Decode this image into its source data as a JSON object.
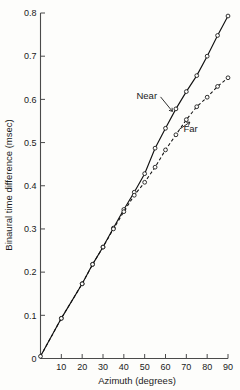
{
  "chart_data": {
    "type": "line",
    "title": "",
    "xlabel": "Azimuth (degrees)",
    "ylabel": "Binaural time difference (msec)",
    "xlim": [
      0,
      90
    ],
    "ylim": [
      0,
      0.8
    ],
    "xticks": [
      0,
      10,
      20,
      30,
      40,
      50,
      60,
      70,
      80,
      90
    ],
    "xtick_labels": [
      "0",
      "10",
      "20",
      "30",
      "40",
      "50",
      "60",
      "70",
      "80",
      "90"
    ],
    "yticks": [
      0,
      0.1,
      0.2,
      0.3,
      0.4,
      0.5,
      0.6,
      0.7,
      0.8
    ],
    "ytick_labels": [
      "0",
      "0.1",
      "0.2",
      "0.3",
      "0.4",
      "0.5",
      "0.6",
      "0.7",
      "0.8"
    ],
    "grid": false,
    "legend_position": "inline-annotation",
    "marker": "open-circle",
    "series": [
      {
        "name": "Near",
        "label": "Near",
        "line_style": "solid",
        "x": [
          0,
          10,
          20,
          25,
          30,
          35,
          40,
          45,
          50,
          55,
          60,
          65,
          70,
          75,
          80,
          85,
          90
        ],
        "values": [
          0.005,
          0.093,
          0.173,
          0.218,
          0.258,
          0.302,
          0.345,
          0.385,
          0.428,
          0.487,
          0.533,
          0.578,
          0.618,
          0.655,
          0.7,
          0.748,
          0.793
        ]
      },
      {
        "name": "Far",
        "label": "Far",
        "line_style": "dashed",
        "x": [
          0,
          10,
          20,
          25,
          30,
          35,
          40,
          45,
          50,
          55,
          60,
          65,
          70,
          75,
          80,
          85,
          90
        ],
        "values": [
          0.005,
          0.093,
          0.173,
          0.218,
          0.258,
          0.3,
          0.34,
          0.378,
          0.408,
          0.443,
          0.483,
          0.518,
          0.553,
          0.583,
          0.605,
          0.63,
          0.65
        ]
      }
    ],
    "annotations": [
      {
        "text": "Near",
        "target_series": "Near",
        "x": 51,
        "y": 0.6
      },
      {
        "text": "Far",
        "target_series": "Far",
        "x": 72,
        "y": 0.525
      }
    ],
    "colors": {
      "line": "#111111",
      "axis": "#4a4a4a",
      "background": "#fdfdfb",
      "marker_fill": "#fdfdfb"
    }
  }
}
